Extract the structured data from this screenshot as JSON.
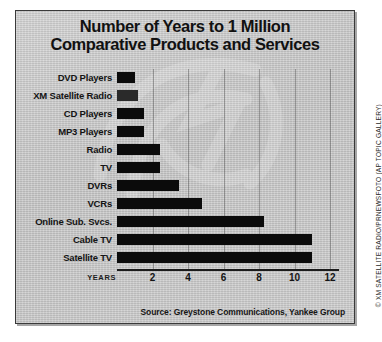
{
  "chart_data": {
    "type": "bar",
    "orientation": "horizontal",
    "title": "Number of Years to 1 Million Comparative Products and Services",
    "title_line1": "Number of Years to 1 Million",
    "title_line2": "Comparative Products and Services",
    "xlabel": "YEARS",
    "ylabel": "",
    "xlim": [
      0,
      12.5
    ],
    "xticks": [
      2,
      4,
      6,
      8,
      10,
      12
    ],
    "grid": true,
    "legend": false,
    "categories": [
      "DVD Players",
      "XM Satellite Radio",
      "CD Players",
      "MP3 Players",
      "Radio",
      "TV",
      "DVRs",
      "VCRs",
      "Online Sub. Svcs.",
      "Cable TV",
      "Satellite TV"
    ],
    "values": [
      1.0,
      1.2,
      1.5,
      1.5,
      2.4,
      2.4,
      3.5,
      4.8,
      8.3,
      11.0,
      11.0
    ],
    "highlight_category": "XM Satellite Radio",
    "source": "Source: Greystone Communications, Yankee Group",
    "credit": "© XM SATELLITE RADIO/PRNEWSFOTO (AP TOPIC GALLERY)",
    "colors": {
      "bar": "#0b0b0b",
      "bar_highlight": "#2a2a2a",
      "background": "#cacaca",
      "text": "#141414",
      "axis": "#1b1b1b"
    }
  }
}
